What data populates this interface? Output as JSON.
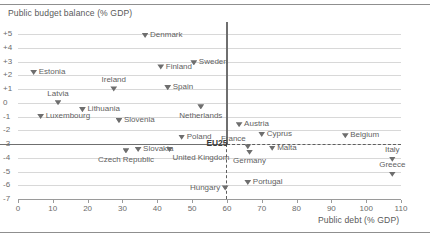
{
  "chart_data": {
    "type": "scatter",
    "title": "",
    "ylabel": "Public budget balance (% GDP)",
    "xlabel": "Public debt (% GDP)",
    "xlim": [
      0,
      110
    ],
    "ylim": [
      -7,
      5
    ],
    "xticks": [
      0,
      10,
      20,
      30,
      40,
      50,
      60,
      70,
      80,
      90,
      100,
      110
    ],
    "yticks": [
      "+5",
      "+4",
      "+3",
      "+2",
      "+1",
      "0",
      "-1",
      "-2",
      "-3",
      "-4",
      "-5",
      "-6",
      "-7"
    ],
    "grid": true,
    "legend": "none",
    "reference_lines": [
      {
        "name": "deficit-threshold",
        "axis": "y",
        "value": -3,
        "style": "solid-thick"
      },
      {
        "name": "debt-threshold",
        "axis": "x",
        "value": 60,
        "style": "solid-thick"
      },
      {
        "name": "deficit-threshold-dashed",
        "axis": "y",
        "value": -3,
        "style": "dashed"
      },
      {
        "name": "debt-threshold-dashed",
        "axis": "x",
        "value": 60,
        "style": "dashed"
      }
    ],
    "points": [
      {
        "label": "Denmark",
        "x": 36.5,
        "y": 4.9,
        "pos": "right"
      },
      {
        "label": "Finland",
        "x": 41.0,
        "y": 2.6,
        "pos": "right"
      },
      {
        "label": "Sweden",
        "x": 50.5,
        "y": 2.9,
        "pos": "right"
      },
      {
        "label": "Estonia",
        "x": 4.5,
        "y": 2.2,
        "pos": "right"
      },
      {
        "label": "Ireland",
        "x": 27.5,
        "y": 1.0,
        "pos": "above"
      },
      {
        "label": "Spain",
        "x": 43.0,
        "y": 1.1,
        "pos": "right"
      },
      {
        "label": "Latvia",
        "x": 11.5,
        "y": 0.0,
        "pos": "above"
      },
      {
        "label": "Lithuania",
        "x": 18.5,
        "y": -0.5,
        "pos": "right"
      },
      {
        "label": "Luxembourg",
        "x": 6.5,
        "y": -1.0,
        "pos": "right"
      },
      {
        "label": "Slovenia",
        "x": 29.0,
        "y": -1.3,
        "pos": "right"
      },
      {
        "label": "Netherlands",
        "x": 52.5,
        "y": -0.3,
        "pos": "below"
      },
      {
        "label": "Poland",
        "x": 47.0,
        "y": -2.5,
        "pos": "right"
      },
      {
        "label": "Austria",
        "x": 63.5,
        "y": -1.6,
        "pos": "right"
      },
      {
        "label": "Cyprus",
        "x": 70.0,
        "y": -2.3,
        "pos": "right"
      },
      {
        "label": "Belgium",
        "x": 94.0,
        "y": -2.4,
        "pos": "right"
      },
      {
        "label": "Czech Republic",
        "x": 31.0,
        "y": -3.5,
        "pos": "below"
      },
      {
        "label": "Slovakia",
        "x": 34.5,
        "y": -3.4,
        "pos": "right"
      },
      {
        "label": "United Kingdom",
        "x": 43.5,
        "y": -3.4,
        "pos": "below-right"
      },
      {
        "label": "EU25",
        "x": 61.0,
        "y": -2.9,
        "pos": "eu25"
      },
      {
        "label": "France",
        "x": 66.0,
        "y": -3.2,
        "pos": "above-right"
      },
      {
        "label": "Germany",
        "x": 66.5,
        "y": -3.6,
        "pos": "below"
      },
      {
        "label": "Malta",
        "x": 73.0,
        "y": -3.3,
        "pos": "right"
      },
      {
        "label": "Italy",
        "x": 107.5,
        "y": -4.1,
        "pos": "above"
      },
      {
        "label": "Greece",
        "x": 107.5,
        "y": -5.2,
        "pos": "above"
      },
      {
        "label": "Hungary",
        "x": 59.5,
        "y": -6.2,
        "pos": "left"
      },
      {
        "label": "Portugal",
        "x": 66.0,
        "y": -5.8,
        "pos": "right"
      }
    ]
  }
}
